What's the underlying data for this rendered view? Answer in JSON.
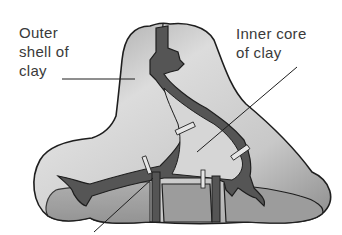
{
  "diagram": {
    "labels": {
      "outer": "Outer\nshell of\nclay",
      "inner": "Inner core\nof clay"
    },
    "colors": {
      "shell_light": "#d8d8d8",
      "shell_dark": "#8a8a8a",
      "channel": "#555555",
      "outline": "#1e1e1e",
      "pins": "#e6e6e6",
      "text": "#3a3a3a"
    }
  }
}
